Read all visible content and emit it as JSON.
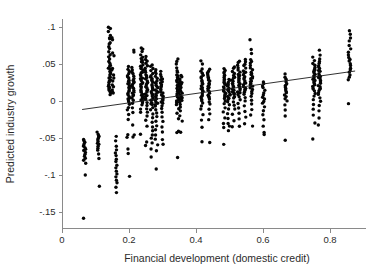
{
  "chart_data": {
    "type": "scatter",
    "title": "",
    "xlabel": "Financial development (domestic credit)",
    "ylabel": "Predicted industry growth",
    "xlim": [
      0,
      0.88
    ],
    "ylim": [
      -0.165,
      0.105
    ],
    "xticks": [
      0,
      0.2,
      0.4,
      0.6,
      0.8
    ],
    "xticklabels": [
      "0",
      "0.2",
      "0.4",
      "0.6",
      "0.8"
    ],
    "yticks": [
      0.1,
      0.05,
      0,
      -0.05,
      -0.1,
      -0.15
    ],
    "yticklabels": [
      ".1",
      ".05",
      "0",
      "-.05",
      "-.1",
      "-.15"
    ],
    "grid": false,
    "legend": null,
    "marker_color": "#050505",
    "marker_size": 3.4,
    "fit_line": {
      "type": "linear",
      "x_start": 0.06,
      "y_start": -0.0115,
      "x_end": 0.875,
      "y_end": 0.0405,
      "slope": 0.0638,
      "intercept": -0.0153,
      "color": "#1a1a1a"
    },
    "series": [
      {
        "name": "Industry observations",
        "note": "Points are grouped into vertical country columns at discrete financial-development values.",
        "columns": [
          {
            "x": 0.068,
            "values": [
              -0.0995,
              -0.0835,
              -0.0805,
              -0.0775,
              -0.0745,
              -0.0715,
              -0.0695,
              -0.0675,
              -0.0655,
              -0.0635,
              -0.0615,
              -0.0595,
              -0.0575,
              -0.0555,
              -0.0535,
              -0.0525,
              -0.159
            ]
          },
          {
            "x": 0.108,
            "values": [
              -0.1145,
              -0.0775,
              -0.0715,
              -0.0665,
              -0.0635,
              -0.0605,
              -0.0585,
              -0.0565,
              -0.0545,
              -0.0525,
              -0.0505,
              -0.0485,
              -0.0465,
              -0.0445,
              -0.0425
            ]
          },
          {
            "x": 0.142,
            "values": [
              0.0995,
              0.0975,
              0.0935,
              0.0885,
              0.0845,
              0.0835,
              0.0795,
              0.0765,
              0.0735,
              0.0705,
              0.0665,
              0.0625,
              0.0595,
              0.0565,
              0.0535,
              0.0505,
              0.0485,
              0.0465,
              0.0445,
              0.0425,
              0.0405,
              0.0385,
              0.0365,
              0.0345,
              0.0325,
              0.0305,
              0.0285,
              0.0265,
              0.0245,
              0.0225,
              0.0205,
              0.0185,
              0.0165,
              0.0145,
              0.0125,
              0.0105,
              0.0085
            ]
          },
          {
            "x": 0.152,
            "values": [
              0.0855,
              0.0825,
              0.0645,
              0.0615,
              0.0435,
              0.0415,
              0.0345,
              0.0305,
              0.0265,
              0.0225,
              0.0185,
              0.0145,
              0.0125,
              0.0105
            ]
          },
          {
            "x": 0.163,
            "values": [
              -0.0475,
              -0.0545,
              -0.0615,
              -0.0665,
              -0.0705,
              -0.0745,
              -0.0785,
              -0.0825,
              -0.0865,
              -0.0905,
              -0.0945,
              -0.0985,
              -0.1025,
              -0.1065,
              -0.1105,
              -0.1165,
              -0.1245
            ]
          },
          {
            "x": 0.198,
            "values": [
              0.0465,
              0.0425,
              0.0395,
              0.0365,
              0.0345,
              0.0325,
              0.0305,
              0.0285,
              0.0265,
              0.0245,
              0.0225,
              0.0205,
              0.0185,
              0.0165,
              0.0145,
              0.0125,
              0.0105,
              0.0085,
              0.0065,
              0.0045,
              0.0025,
              0.0005,
              -0.0015,
              -0.0045,
              -0.0085,
              -0.0125,
              -0.0185,
              -0.0245,
              -0.0455,
              -0.0495,
              -0.0655,
              -0.0705,
              -0.1015
            ]
          },
          {
            "x": 0.212,
            "values": [
              0.0685,
              0.0655,
              0.0455,
              0.0425,
              0.0395,
              0.0365,
              0.0335,
              0.0305,
              0.0285,
              0.0265,
              0.0245,
              0.0225,
              0.0205,
              0.0185,
              0.0165,
              0.0145,
              0.0125,
              0.0105,
              0.0085,
              0.0065,
              0.0045,
              0.0015,
              -0.0025,
              -0.0085,
              -0.0155,
              -0.0325,
              -0.0455,
              -0.0485
            ]
          },
          {
            "x": 0.238,
            "values": [
              0.0715,
              0.0695,
              0.0665,
              0.0625,
              0.0595,
              0.0575,
              0.0555,
              0.0535,
              0.0515,
              0.0495,
              0.0475,
              0.0455,
              0.0435,
              0.0415,
              0.0395,
              0.0375,
              0.0355,
              0.0335,
              0.0315,
              0.0295,
              0.0275,
              0.0255,
              0.0235,
              0.0215,
              0.0195,
              0.0175,
              0.0155,
              0.0135,
              0.0115,
              0.0095,
              0.0075,
              0.0055,
              0.0035,
              0.0015,
              -0.0005,
              -0.0025,
              -0.0055,
              -0.0105,
              -0.0145,
              -0.0455
            ]
          },
          {
            "x": 0.252,
            "values": [
              0.0595,
              0.0565,
              0.0535,
              0.0505,
              0.0475,
              0.0445,
              0.0415,
              0.0385,
              0.0355,
              0.0335,
              0.0315,
              0.0295,
              0.0275,
              0.0255,
              0.0235,
              0.0215,
              0.0195,
              0.0175,
              0.0155,
              0.0135,
              0.0115,
              0.0095,
              0.0075,
              0.0055,
              0.0035,
              0.0015,
              -0.0015,
              -0.0055,
              -0.0105,
              -0.0155,
              -0.0205,
              -0.0255,
              -0.0345,
              -0.0555,
              -0.0595
            ]
          },
          {
            "x": 0.268,
            "values": [
              0.0495,
              0.0465,
              0.0435,
              0.0405,
              0.0375,
              0.0345,
              0.0325,
              0.0305,
              0.0285,
              0.0265,
              0.0245,
              0.0225,
              0.0205,
              0.0185,
              0.0165,
              0.0145,
              0.0125,
              0.0105,
              0.0085,
              0.0065,
              0.0045,
              0.0025,
              0.0005,
              -0.0015,
              -0.0035,
              -0.0055,
              -0.0085,
              -0.0125,
              -0.0175,
              -0.0225,
              -0.0285,
              -0.0345,
              -0.0405,
              -0.0455,
              -0.0505,
              -0.0565,
              -0.0645,
              -0.0755
            ]
          },
          {
            "x": 0.282,
            "values": [
              0.0425,
              0.0395,
              0.0365,
              0.0335,
              0.0305,
              0.0275,
              0.0255,
              0.0235,
              0.0215,
              0.0195,
              0.0175,
              0.0155,
              0.0135,
              0.0115,
              0.0095,
              0.0075,
              0.0055,
              0.0035,
              0.0015,
              -0.0005,
              -0.0025,
              -0.0045,
              -0.0075,
              -0.0115,
              -0.0165,
              -0.0215,
              -0.0275,
              -0.0335,
              -0.0395,
              -0.0455,
              -0.0515,
              -0.0585,
              -0.0665,
              -0.0915
            ]
          },
          {
            "x": 0.298,
            "values": [
              0.0395,
              0.0365,
              0.0335,
              0.0305,
              0.0285,
              0.0265,
              0.0245,
              0.0225,
              0.0205,
              0.0185,
              0.0165,
              0.0145,
              0.0125,
              0.0105,
              0.0085,
              0.0065,
              0.0045,
              0.0025,
              0.0005,
              -0.0015,
              -0.0035,
              -0.0065,
              -0.0105,
              -0.0155,
              -0.0215,
              -0.0275,
              -0.0345,
              -0.0425,
              -0.0515,
              -0.0585
            ]
          },
          {
            "x": 0.345,
            "values": [
              0.0565,
              0.0535,
              0.0495,
              0.0455,
              0.0415,
              0.0385,
              0.0355,
              0.0335,
              0.0315,
              0.0295,
              0.0275,
              0.0255,
              0.0235,
              0.0215,
              0.0195,
              0.0175,
              0.0155,
              0.0135,
              0.0115,
              0.0095,
              0.0075,
              0.0055,
              0.0035,
              0.0015,
              -0.0005,
              -0.0025,
              -0.0055,
              -0.0105,
              -0.0165,
              -0.0235,
              -0.0405,
              -0.0425,
              -0.0765
            ]
          },
          {
            "x": 0.355,
            "values": [
              0.0345,
              0.0325,
              0.0305,
              0.0285,
              0.0265,
              0.0245,
              0.0225,
              0.0205,
              0.0185,
              0.0165,
              0.0145,
              0.0125,
              0.0105,
              0.0085,
              0.0065,
              0.0045,
              0.0025,
              0.0005,
              -0.0015,
              -0.0045,
              -0.0085,
              -0.0135,
              -0.0205,
              -0.0275,
              -0.0415
            ]
          },
          {
            "x": 0.418,
            "values": [
              0.0535,
              0.0505,
              0.0435,
              0.0405,
              0.0375,
              0.0345,
              0.0325,
              0.0305,
              0.0285,
              0.0265,
              0.0245,
              0.0225,
              0.0205,
              0.0185,
              0.0165,
              0.0145,
              0.0125,
              0.0105,
              0.0085,
              0.0065,
              0.0045,
              0.0025,
              0.0005,
              -0.0025,
              -0.0065,
              -0.0115,
              -0.0185,
              -0.0265,
              -0.0355,
              -0.0555
            ]
          },
          {
            "x": 0.438,
            "values": [
              0.0425,
              0.0405,
              0.0385,
              0.0365,
              0.0345,
              0.0325,
              0.0305,
              0.0285,
              0.0265,
              0.0245,
              0.0225,
              0.0205,
              0.0185,
              0.0165,
              0.0145,
              0.0125,
              0.0105,
              0.0085,
              0.0065,
              0.0045,
              0.0025,
              -0.0005,
              -0.0045,
              -0.0105,
              -0.0175,
              -0.0255,
              -0.0555
            ]
          },
          {
            "x": 0.485,
            "values": [
              0.0435,
              0.0415,
              0.0395,
              0.0375,
              0.0355,
              0.0335,
              0.0315,
              0.0295,
              0.0275,
              0.0255,
              0.0235,
              0.0215,
              0.0195,
              0.0175,
              0.0155,
              0.0135,
              0.0115,
              0.0095,
              0.0075,
              0.0055,
              0.0035,
              0.0005,
              -0.0035,
              -0.0085,
              -0.0145,
              -0.0225,
              -0.0305,
              -0.0355,
              -0.0585
            ]
          },
          {
            "x": 0.498,
            "values": [
              0.0295,
              0.0275,
              0.0255,
              0.0235,
              0.0215,
              0.0195,
              0.0175,
              0.0155,
              0.0135,
              0.0115,
              0.0095,
              0.0075,
              0.0055,
              0.0035,
              0.0015,
              -0.0015,
              -0.0055,
              -0.0105,
              -0.0165,
              -0.0235,
              -0.0305,
              -0.0345,
              -0.0395
            ]
          },
          {
            "x": 0.512,
            "values": [
              0.0465,
              0.0435,
              0.0405,
              0.0375,
              0.0345,
              0.0325,
              0.0305,
              0.0285,
              0.0265,
              0.0245,
              0.0225,
              0.0205,
              0.0185,
              0.0165,
              0.0145,
              0.0125,
              0.0105,
              0.0085,
              0.0065,
              0.0035,
              -0.0005,
              -0.0055,
              -0.0115,
              -0.0185,
              -0.0265,
              -0.0355
            ]
          },
          {
            "x": 0.528,
            "values": [
              0.0545,
              0.0515,
              0.0485,
              0.0455,
              0.0425,
              0.0395,
              0.0365,
              0.0345,
              0.0325,
              0.0305,
              0.0285,
              0.0265,
              0.0245,
              0.0225,
              0.0205,
              0.0185,
              0.0165,
              0.0145,
              0.0125,
              0.0105,
              0.0085,
              0.0055,
              0.0015,
              -0.0035,
              -0.0095,
              -0.0165,
              -0.0245,
              -0.0335
            ]
          },
          {
            "x": 0.545,
            "values": [
              0.0565,
              0.0535,
              0.0505,
              0.0475,
              0.0445,
              0.0415,
              0.0395,
              0.0375,
              0.0355,
              0.0335,
              0.0315,
              0.0295,
              0.0275,
              0.0255,
              0.0235,
              0.0215,
              0.0195,
              0.0175,
              0.0155,
              0.0135,
              0.0115,
              0.0085,
              0.0045,
              -0.0005,
              -0.0065,
              -0.0135,
              -0.0215,
              -0.0305
            ]
          },
          {
            "x": 0.565,
            "values": [
              0.0825,
              0.0695,
              0.0645,
              0.0565,
              0.0535,
              0.0505,
              0.0475,
              0.0445,
              0.0415,
              0.0395,
              0.0375,
              0.0355,
              0.0335,
              0.0315,
              0.0295,
              0.0275,
              0.0255,
              0.0235,
              0.0215,
              0.0195,
              0.0175,
              0.0155,
              0.0135,
              0.0105,
              0.0065,
              0.0015,
              -0.0045,
              -0.0115,
              -0.0195,
              -0.0335
            ]
          },
          {
            "x": 0.602,
            "values": [
              0.0265,
              0.0235,
              0.0205,
              0.0175,
              0.0145,
              0.0115,
              0.0085,
              0.0055,
              0.0025,
              -0.0005,
              -0.0035,
              -0.0075,
              -0.0125,
              -0.0185,
              -0.0255,
              -0.0335,
              -0.0425,
              -0.0455
            ]
          },
          {
            "x": 0.668,
            "values": [
              0.0365,
              0.0325,
              0.0295,
              0.0265,
              0.0235,
              0.0205,
              0.0185,
              0.0165,
              0.0145,
              0.0125,
              0.0105,
              0.0085,
              0.0065,
              0.0035,
              -0.0005,
              -0.0055,
              -0.0115,
              -0.0205,
              -0.0525
            ]
          },
          {
            "x": 0.752,
            "values": [
              0.0595,
              0.0545,
              0.0515,
              0.0485,
              0.0455,
              0.0435,
              0.0415,
              0.0395,
              0.0375,
              0.0355,
              0.0335,
              0.0315,
              0.0295,
              0.0275,
              0.0255,
              0.0235,
              0.0215,
              0.0195,
              0.0175,
              0.0155,
              0.0135,
              0.0105,
              0.0065,
              0.0015,
              -0.0045,
              -0.0115,
              -0.0195,
              -0.0295,
              -0.0515
            ]
          },
          {
            "x": 0.768,
            "values": [
              0.0685,
              0.0625,
              0.0565,
              0.0535,
              0.0505,
              0.0475,
              0.0455,
              0.0435,
              0.0415,
              0.0395,
              0.0375,
              0.0355,
              0.0335,
              0.0315,
              0.0295,
              0.0275,
              0.0255,
              0.0235,
              0.0215,
              0.0195,
              0.0175,
              0.0155,
              0.0135,
              0.0115,
              0.0085,
              0.0045,
              -0.0005,
              -0.0065,
              -0.0135,
              -0.0225,
              -0.0325
            ]
          },
          {
            "x": 0.858,
            "values": [
              0.0955,
              0.0905,
              0.0855,
              0.0805,
              0.0755,
              0.0705,
              0.0665,
              0.0625,
              0.0595,
              0.0565,
              0.0535,
              0.0505,
              0.0475,
              0.0445,
              0.0415,
              0.0385,
              0.0355,
              0.0325,
              0.0295,
              -0.0035
            ]
          }
        ]
      }
    ]
  }
}
